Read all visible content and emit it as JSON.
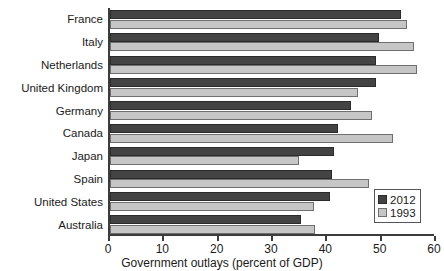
{
  "chart_data": {
    "type": "bar",
    "orientation": "horizontal",
    "title": "",
    "xlabel": "Government outlays (percent of GDP)",
    "ylabel": "",
    "xlim": [
      0,
      60
    ],
    "xticks": [
      0,
      10,
      20,
      30,
      40,
      50,
      60
    ],
    "xtick_labels": [
      "0",
      "10",
      "20",
      "30",
      "40",
      "50",
      "60"
    ],
    "grid": false,
    "legend_position": "lower-right",
    "categories": [
      "France",
      "Italy",
      "Netherlands",
      "United Kingdom",
      "Germany",
      "Canada",
      "Japan",
      "Spain",
      "United States",
      "Australia"
    ],
    "series": [
      {
        "name": "2012",
        "color": "#434343",
        "values": [
          53.6,
          49.5,
          49.0,
          48.9,
          44.4,
          42.0,
          41.3,
          40.9,
          40.5,
          35.2
        ]
      },
      {
        "name": "1993",
        "color": "#c6c6c6",
        "values": [
          54.7,
          56.0,
          56.5,
          45.7,
          48.3,
          52.0,
          34.8,
          47.7,
          37.6,
          37.7
        ]
      }
    ]
  },
  "legend": {
    "entries": [
      {
        "label": "2012"
      },
      {
        "label": "1993"
      }
    ]
  }
}
